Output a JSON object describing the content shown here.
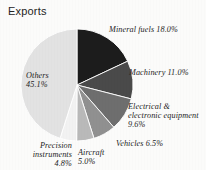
{
  "title": "Exports",
  "chart_data": {
    "type": "pie",
    "title": "Exports",
    "unit": "%",
    "start_angle_deg": 0,
    "direction": "clockwise",
    "center": {
      "x": 77,
      "y": 85
    },
    "radius": 56,
    "categories": [
      "Mineral fuels",
      "Machinery",
      "Electrical & electronic equipment",
      "Vehicles",
      "Aircraft",
      "Precision instruments",
      "Others"
    ],
    "values": [
      18.0,
      11.0,
      9.6,
      6.5,
      5.0,
      4.8,
      45.1
    ],
    "colors": [
      "#1c1c1c",
      "#4a4a4a",
      "#6e6e6e",
      "#909090",
      "#b9b9b9",
      "#f2f2f2",
      "#e2e2e2"
    ],
    "slices": [
      {
        "label": "Mineral fuels",
        "value": 18.0,
        "value_text": "18.0%",
        "color": "#1c1c1c",
        "label_text": "Mineral fuels 18.0%"
      },
      {
        "label": "Machinery",
        "value": 11.0,
        "value_text": "11.0%",
        "color": "#4a4a4a",
        "label_text": "Machinery 11.0%"
      },
      {
        "label": "Electrical & electronic equipment",
        "value": 9.6,
        "value_text": "9.6%",
        "color": "#6e6e6e",
        "label_text": "Electrical &\nelectronic equipment\n9.6%"
      },
      {
        "label": "Vehicles",
        "value": 6.5,
        "value_text": "6.5%",
        "color": "#909090",
        "label_text": "Vehicles 6.5%"
      },
      {
        "label": "Aircraft",
        "value": 5.0,
        "value_text": "5.0%",
        "color": "#b9b9b9",
        "label_text": "Aircraft\n5.0%"
      },
      {
        "label": "Precision instruments",
        "value": 4.8,
        "value_text": "4.8%",
        "color": "#f2f2f2",
        "label_text": "Precision\ninstruments\n4.8%"
      },
      {
        "label": "Others",
        "value": 45.1,
        "value_text": "45.1%",
        "color": "#e2e2e2",
        "label_text": "Others\n45.1%"
      }
    ],
    "legend": "none",
    "grid": false
  }
}
